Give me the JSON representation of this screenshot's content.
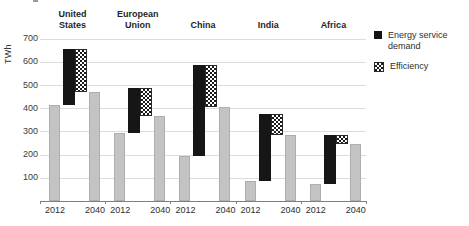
{
  "chart_data": {
    "type": "bar",
    "subtype": "waterfall",
    "title": "",
    "ylabel": "TWh",
    "xlabel": "",
    "ylim": [
      0,
      700
    ],
    "yticks": [
      100,
      200,
      300,
      400,
      500,
      600,
      700
    ],
    "grid": "horizontal",
    "legend_position": "right",
    "x_tick_labels": [
      "2012",
      "2040"
    ],
    "legend": [
      {
        "label": "Energy service demand",
        "swatch": "solid-black-square"
      },
      {
        "label": "Efficiency",
        "swatch": "crosshatch-square"
      }
    ],
    "groups": [
      {
        "name": "United States",
        "value_2012": 415,
        "peak_with_demand": 655,
        "value_2040": 470
      },
      {
        "name": "European Union",
        "value_2012": 295,
        "peak_with_demand": 485,
        "value_2040": 365
      },
      {
        "name": "China",
        "value_2012": 195,
        "peak_with_demand": 585,
        "value_2040": 405
      },
      {
        "name": "India",
        "value_2012": 85,
        "peak_with_demand": 375,
        "value_2040": 285
      },
      {
        "name": "Africa",
        "value_2012": 75,
        "peak_with_demand": 285,
        "value_2040": 245
      }
    ],
    "series_semantics": {
      "gray_bars": "total electricity demand in year shown",
      "black_segment": "growth from energy service demand (2012 level up to peak)",
      "crosshatch_segment": "savings from efficiency (peak down to 2040 level)"
    },
    "colors": {
      "bar_gray": "#c3c3c3",
      "bar_black": "#161616",
      "crosshatch": "black-white-checker",
      "gridline": "#dcdcdc",
      "axis": "#7f7f7f",
      "text": "#2e2e2e"
    }
  }
}
